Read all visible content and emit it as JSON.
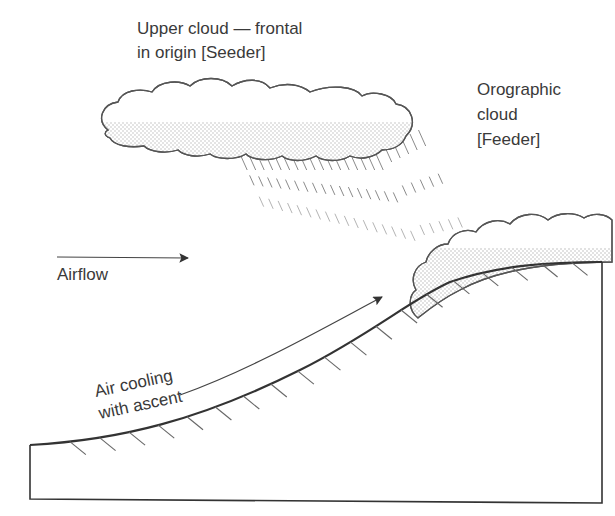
{
  "diagram": {
    "type": "seeder-feeder orographic precipitation",
    "labels": {
      "upper_cloud_line1": "Upper cloud — frontal",
      "upper_cloud_line2": "in origin [Seeder]",
      "orographic_line1": "Orographic",
      "orographic_line2": "cloud",
      "orographic_line3": "[Feeder]",
      "airflow": "Airflow",
      "ascent_line1": "Air cooling",
      "ascent_line2": "with ascent"
    },
    "elements": [
      {
        "name": "upper-cloud",
        "role": "seeder"
      },
      {
        "name": "orographic-cloud",
        "role": "feeder"
      },
      {
        "name": "rain-streaks",
        "from": "upper-cloud",
        "to": "orographic-cloud"
      },
      {
        "name": "airflow-arrow",
        "direction": "right"
      },
      {
        "name": "ascent-arrow",
        "direction": "up-slope"
      },
      {
        "name": "hill-slope",
        "hatched": true
      }
    ],
    "colors": {
      "ink": "#333333",
      "text": "#3a3a3a",
      "stipple": "#9a9a9a"
    }
  }
}
